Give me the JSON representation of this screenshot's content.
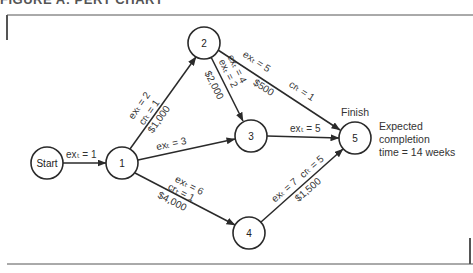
{
  "header": {
    "text": "FIGURE A: PERT CHART"
  },
  "nodes": [
    {
      "id": "start",
      "label": "Start",
      "x": 47,
      "y": 163
    },
    {
      "id": "1",
      "label": "1",
      "x": 122,
      "y": 163
    },
    {
      "id": "2",
      "label": "2",
      "x": 204,
      "y": 43
    },
    {
      "id": "3",
      "label": "3",
      "x": 251,
      "y": 136
    },
    {
      "id": "4",
      "label": "4",
      "x": 249,
      "y": 233
    },
    {
      "id": "5",
      "label": "5",
      "x": 355,
      "y": 138
    }
  ],
  "edges": [
    {
      "from": "start",
      "to": "1",
      "labels": [
        "exₜ = 1"
      ]
    },
    {
      "from": "1",
      "to": "2",
      "labels": [
        "exₜ = 2",
        "crₜ = 1",
        "$1,000"
      ]
    },
    {
      "from": "1",
      "to": "3",
      "labels": [
        "exₜ = 3"
      ]
    },
    {
      "from": "1",
      "to": "4",
      "labels": [
        "exₜ = 6",
        "crₜ = 1",
        "$4,000"
      ]
    },
    {
      "from": "2",
      "to": "3",
      "labels": [
        "exₜ = 4",
        "exₜ = 2",
        "$2,000"
      ]
    },
    {
      "from": "2",
      "to": "5",
      "labels": [
        "exₜ = 5",
        "crₜ = 1",
        "$500"
      ]
    },
    {
      "from": "3",
      "to": "5",
      "labels": [
        "exₜ = 5"
      ]
    },
    {
      "from": "4",
      "to": "5",
      "labels": [
        "exₜ = 7",
        "crₜ = 5",
        "$1,500"
      ]
    }
  ],
  "labels": {
    "finish": "Finish",
    "completion_line1": "Expected",
    "completion_line2": "completion",
    "completion_line3": "time = 14 weeks"
  },
  "edge_text": {
    "s1": "exₜ = 1",
    "a12_1": "exₜ = 2",
    "a12_2": "crₜ = 1",
    "a12_3": "$1,000",
    "a13": "exₜ = 3",
    "a14_1": "exₜ = 6",
    "a14_2": "crₜ = 1",
    "a14_3": "$4,000",
    "a23_1": "exₜ = 4",
    "a23_2": "exₜ = 2",
    "a23_3": "$2,000",
    "a25_1": "exₜ = 5",
    "a25_2": "crₜ = 1",
    "a25_3": "$500",
    "a35": "exₜ = 5",
    "a45_1": "exₜ = 7",
    "a45_2": "crₜ = 5",
    "a45_3": "$1,500"
  },
  "node_labels": {
    "start": "Start",
    "n1": "1",
    "n2": "2",
    "n3": "3",
    "n4": "4",
    "n5": "5"
  }
}
